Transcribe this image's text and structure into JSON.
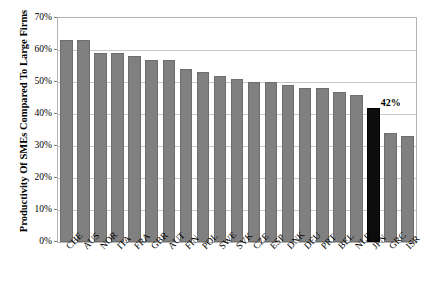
{
  "chart_data": {
    "type": "bar",
    "title": "",
    "xlabel": "",
    "ylabel": "Productivity Of SMEs Compared To Large Firms",
    "ylim": [
      0,
      70
    ],
    "ytick_labels": [
      "0%",
      "10%",
      "20%",
      "30%",
      "40%",
      "50%",
      "60%",
      "70%"
    ],
    "ytick_values": [
      0,
      10,
      20,
      30,
      40,
      50,
      60,
      70
    ],
    "grid": true,
    "legend": "none",
    "categories": [
      "CHE",
      "AUS",
      "NOR",
      "ITA",
      "FRA",
      "GBR",
      "AUT",
      "FIN",
      "POL",
      "SWE",
      "SVK",
      "CZE",
      "ESP",
      "DNK",
      "DEU",
      "PRT",
      "BEL",
      "NLD",
      "JPN",
      "GRC",
      "ISR"
    ],
    "values": [
      63,
      63,
      59,
      59,
      58,
      57,
      57,
      54,
      53,
      52,
      51,
      50,
      50,
      49,
      48,
      48,
      47,
      46,
      42,
      34,
      33
    ],
    "annotations": [
      {
        "category": "JPN",
        "text": "42%",
        "value": 42
      }
    ],
    "highlight_category": "JPN",
    "colors": {
      "bar": "#808080",
      "bar_border": "#6e6e6e",
      "highlight_bar": "#0d0d0d",
      "gridline": "#c8c8c8",
      "plot_border": "#b4b4b4",
      "text": "#000000",
      "background": "#ffffff"
    }
  }
}
